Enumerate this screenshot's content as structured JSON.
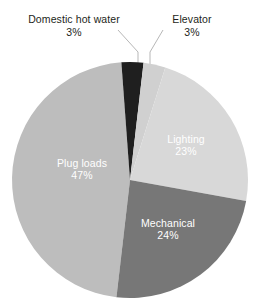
{
  "chart_data": {
    "type": "pie",
    "title": "",
    "subtitle": "",
    "xlabel": "",
    "ylabel": "",
    "legend_position": "none",
    "grid": false,
    "units": "percent",
    "total": 100,
    "categories": [
      "Domestic hot water",
      "Elevator",
      "Lighting",
      "Mechanical",
      "Plug loads"
    ],
    "values": [
      3,
      3,
      23,
      24,
      47
    ],
    "slices": [
      {
        "label": "Domestic hot water",
        "value": 3,
        "value_text": "3%",
        "color": "#1f1f1f",
        "label_placement": "outside",
        "label_color": "#231f20",
        "leader_line": true
      },
      {
        "label": "Elevator",
        "value": 3,
        "value_text": "3%",
        "color": "#d0d0d0",
        "label_placement": "outside",
        "label_color": "#231f20",
        "leader_line": true
      },
      {
        "label": "Lighting",
        "value": 23,
        "value_text": "23%",
        "color": "#d8d8d8",
        "label_placement": "inside",
        "label_color": "#ffffff",
        "leader_line": false
      },
      {
        "label": "Mechanical",
        "value": 24,
        "value_text": "24%",
        "color": "#777777",
        "label_placement": "inside",
        "label_color": "#ffffff",
        "leader_line": false
      },
      {
        "label": "Plug loads",
        "value": 47,
        "value_text": "47%",
        "color": "#bdbdbd",
        "label_placement": "inside",
        "label_color": "#ffffff",
        "leader_line": false
      }
    ]
  },
  "callouts": {
    "domestic_hot_water": {
      "name": "Domestic hot water",
      "value_text": "3%"
    },
    "elevator": {
      "name": "Elevator",
      "value_text": "3%"
    }
  },
  "inline_labels": {
    "lighting": {
      "name": "Lighting",
      "value_text": "23%"
    },
    "mechanical": {
      "name": "Mechanical",
      "value_text": "24%"
    },
    "plug_loads": {
      "name": "Plug loads",
      "value_text": "47%"
    }
  },
  "colors": {
    "background": "#ffffff",
    "text": "#231f20",
    "inline_text": "#ffffff",
    "leader_line": "#b7b7b7",
    "domestic_hot_water": "#1f1f1f",
    "elevator": "#d0d0d0",
    "lighting": "#d8d8d8",
    "mechanical": "#777777",
    "plug_loads": "#bdbdbd"
  }
}
